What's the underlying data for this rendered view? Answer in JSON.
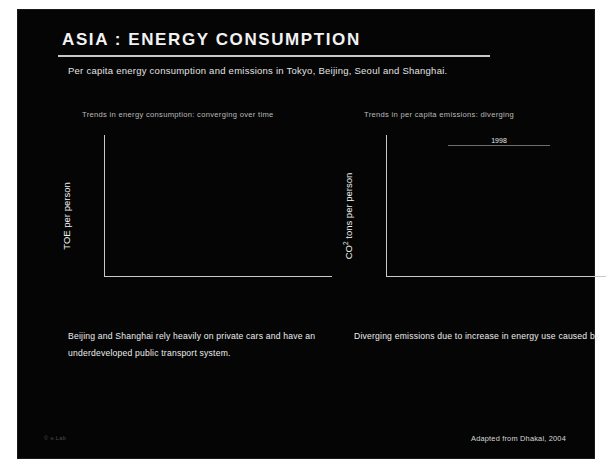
{
  "header": {
    "title": "ASIA : ENERGY CONSUMPTION",
    "subtitle": "Per capita energy consumption and emissions in Tokyo, Beijing, Seoul and Shanghai."
  },
  "footer": {
    "left_mark": "© e.Lab",
    "source": "Adapted from Dhakal, 2004"
  },
  "body": {
    "left_text": "Beijing and Shanghai rely heavily on private cars and have an underdeveloped public transport system.",
    "right_intro": "Diverging emissions due to increase in energy use caused by",
    "right_bullets": [
      "continuous economic growth,",
      "improvements in energy efficiency,",
      "coal dependency of Beijing and Shanghai,",
      "Tokyo's efficient urban infrastructure."
    ]
  },
  "chart_data": [
    {
      "type": "line",
      "id": "energy-consumption",
      "title": "Trends in energy consumption: converging over time",
      "xlabel": "",
      "ylabel": "TOE per person",
      "xlim": [
        1960,
        2010
      ],
      "ylim": [
        0.0,
        2.0
      ],
      "xticks": [
        1960,
        1970,
        1980,
        1990,
        2000,
        2010
      ],
      "yticks": [
        "0.00",
        "0.40",
        "0.80",
        "1.20",
        "1.60",
        "2.00"
      ],
      "grid": true,
      "legend": "inline-right",
      "series": [
        {
          "name": "Shanghai",
          "color": "#f0f0f0",
          "marker": "circle",
          "trend": [
            [
              1970,
              0.14
            ],
            [
              2000,
              1.62
            ]
          ],
          "points": [
            [
              1985,
              0.63
            ],
            [
              1990,
              0.86
            ],
            [
              1991,
              0.9
            ],
            [
              1992,
              0.98
            ],
            [
              1993,
              1.08
            ],
            [
              1994,
              1.2
            ],
            [
              1995,
              1.3
            ],
            [
              1996,
              1.4
            ],
            [
              1997,
              1.5
            ],
            [
              1998,
              1.56
            ],
            [
              1999,
              1.6
            ]
          ]
        },
        {
          "name": "Tokyo",
          "color": "#e8e8e8",
          "marker": "circle",
          "trend": [
            [
              1970,
              0.9
            ],
            [
              2000,
              1.58
            ]
          ],
          "points": [
            [
              1970,
              0.88
            ],
            [
              1985,
              1.12
            ],
            [
              1990,
              1.28
            ],
            [
              1993,
              1.42
            ],
            [
              1995,
              1.5
            ],
            [
              1997,
              1.54
            ],
            [
              1998,
              1.56
            ]
          ]
        },
        {
          "name": "Seoul",
          "color": "#d8d8d8",
          "marker": "triangle",
          "trend": [
            [
              1970,
              0.24
            ],
            [
              2000,
              1.52
            ]
          ],
          "points": [
            [
              1985,
              0.66
            ],
            [
              1988,
              0.78
            ],
            [
              1990,
              0.96
            ],
            [
              1992,
              1.08
            ],
            [
              1993,
              1.16
            ],
            [
              1994,
              1.24
            ],
            [
              1995,
              1.34
            ],
            [
              1996,
              1.42
            ],
            [
              1997,
              1.48
            ],
            [
              1999,
              1.52
            ]
          ]
        },
        {
          "name": "Beijing",
          "color": "#6d6d6d",
          "marker": "square",
          "trend": [
            [
              1985,
              1.12
            ],
            [
              1999,
              1.3
            ]
          ],
          "points": [
            [
              1985,
              1.18
            ],
            [
              1990,
              1.14
            ],
            [
              1993,
              1.2
            ],
            [
              1995,
              1.24
            ],
            [
              1997,
              1.3
            ],
            [
              1999,
              1.28
            ]
          ]
        }
      ]
    },
    {
      "type": "line",
      "id": "per-capita-emissions",
      "title": "Trends in per capita emissions: diverging",
      "xlabel": "",
      "ylabel": "CO2 tons per person",
      "xlim": [
        1960,
        2010
      ],
      "ylim": [
        0.0,
        10.0
      ],
      "xticks": [
        1960,
        1970,
        1980,
        1990,
        2000,
        2010
      ],
      "yticks": [
        "0.00",
        "2.00",
        "4.00",
        "6.00",
        "8.00",
        "10.00"
      ],
      "grid": true,
      "legend": "inline-right",
      "series": [
        {
          "name": "Shanghai",
          "color": "#f2f2f2",
          "marker": "circle",
          "trend": [
            [
              1970,
              0.1
            ],
            [
              2000,
              8.6
            ]
          ],
          "points": [
            [
              1985,
              3.3
            ],
            [
              1990,
              4.6
            ],
            [
              1992,
              5.4
            ],
            [
              1993,
              6.0
            ],
            [
              1994,
              6.6
            ],
            [
              1995,
              7.2
            ],
            [
              1996,
              7.8
            ],
            [
              1997,
              8.2
            ],
            [
              1998,
              8.12
            ],
            [
              1999,
              8.5
            ]
          ]
        },
        {
          "name": "Beijing",
          "color": "#787878",
          "marker": "square",
          "trend": [
            [
              1970,
              1.5
            ],
            [
              2000,
              7.0
            ]
          ],
          "points": [
            [
              1985,
              3.6
            ],
            [
              1990,
              5.1
            ],
            [
              1993,
              6.0
            ],
            [
              1995,
              6.5
            ],
            [
              1997,
              6.9
            ],
            [
              1998,
              6.9
            ]
          ]
        },
        {
          "name": "Tokyo",
          "color": "#ebebeb",
          "marker": "circle",
          "trend": [
            [
              1970,
              2.9
            ],
            [
              2000,
              4.6
            ]
          ],
          "points": [
            [
              1970,
              2.7
            ],
            [
              1985,
              3.5
            ],
            [
              1990,
              3.9
            ],
            [
              1993,
              4.2
            ],
            [
              1995,
              4.4
            ],
            [
              1997,
              4.5
            ],
            [
              1998,
              4.84
            ]
          ]
        },
        {
          "name": "Seoul",
          "color": "#d5d5d5",
          "marker": "triangle",
          "trend": [
            [
              1970,
              1.0
            ],
            [
              2000,
              3.9
            ]
          ],
          "points": [
            [
              1985,
              2.3
            ],
            [
              1990,
              2.8
            ],
            [
              1992,
              3.0
            ],
            [
              1993,
              3.2
            ],
            [
              1994,
              3.4
            ],
            [
              1995,
              3.5
            ],
            [
              1996,
              3.6
            ],
            [
              1997,
              3.7
            ],
            [
              1998,
              3.76
            ],
            [
              1999,
              3.2
            ]
          ]
        }
      ]
    },
    {
      "type": "bar",
      "id": "emissions-1998-inset",
      "title": "1998",
      "orientation": "horizontal",
      "categories": [
        "Shanghai",
        "Beijing",
        "Seoul",
        "Tokyo"
      ],
      "values": [
        8.12,
        6.9,
        3.76,
        4.84
      ],
      "value_labels": [
        "8.12",
        "6.90",
        "3.76",
        "4.84"
      ],
      "xlim": [
        0,
        10
      ],
      "bar_color": "#9a9a9a"
    }
  ]
}
